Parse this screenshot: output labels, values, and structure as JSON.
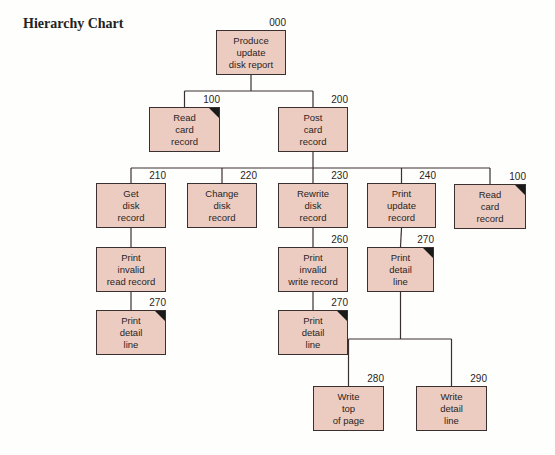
{
  "title": "Hierarchy Chart",
  "colors": {
    "box_fill": "#ecccc0",
    "line": "#3a3030",
    "background": "#fefefc"
  },
  "nodes": [
    {
      "id": "n000",
      "num": "000",
      "label": "Produce\nupdate\ndisk report",
      "x": 216,
      "y": 30,
      "w": 70,
      "h": 45,
      "common": false
    },
    {
      "id": "n100a",
      "num": "100",
      "label": "Read\ncard\nrecord",
      "x": 149,
      "y": 107,
      "w": 71,
      "h": 45,
      "common": true
    },
    {
      "id": "n200",
      "num": "200",
      "label": "Post\ncard\nrecord",
      "x": 278,
      "y": 107,
      "w": 70,
      "h": 45,
      "common": false
    },
    {
      "id": "n210",
      "num": "210",
      "label": "Get\ndisk\nrecord",
      "x": 96,
      "y": 183,
      "w": 70,
      "h": 45,
      "common": false
    },
    {
      "id": "n220",
      "num": "220",
      "label": "Change\ndisk\nrecord",
      "x": 187,
      "y": 183,
      "w": 70,
      "h": 45,
      "common": false
    },
    {
      "id": "n230",
      "num": "230",
      "label": "Rewrite\ndisk\nrecord",
      "x": 278,
      "y": 183,
      "w": 70,
      "h": 45,
      "common": false
    },
    {
      "id": "n240",
      "num": "240",
      "label": "Print\nupdate\nrecord",
      "x": 367,
      "y": 183,
      "w": 69,
      "h": 45,
      "common": false
    },
    {
      "id": "n100b",
      "num": "100",
      "label": "Read\ncard\nrecord",
      "x": 454,
      "y": 184,
      "w": 72,
      "h": 45,
      "common": true
    },
    {
      "id": "n_pirr",
      "num": "",
      "label": "Print\ninvalid\nread record",
      "x": 96,
      "y": 247,
      "w": 70,
      "h": 45,
      "common": false
    },
    {
      "id": "n260",
      "num": "260",
      "label": "Print\ninvalid\nwrite record",
      "x": 278,
      "y": 247,
      "w": 70,
      "h": 45,
      "common": false
    },
    {
      "id": "n270c",
      "num": "270",
      "label": "Print\ndetail\nline",
      "x": 367,
      "y": 247,
      "w": 67,
      "h": 45,
      "common": true
    },
    {
      "id": "n270a",
      "num": "270",
      "label": "Print\ndetail\nline",
      "x": 96,
      "y": 310,
      "w": 70,
      "h": 45,
      "common": true
    },
    {
      "id": "n270b",
      "num": "270",
      "label": "Print\ndetail\nline",
      "x": 278,
      "y": 310,
      "w": 70,
      "h": 45,
      "common": true
    },
    {
      "id": "n280",
      "num": "280",
      "label": "Write\ntop\nof page",
      "x": 313,
      "y": 386,
      "w": 71,
      "h": 45,
      "common": false
    },
    {
      "id": "n290",
      "num": "290",
      "label": "Write\ndetail\nline",
      "x": 416,
      "y": 386,
      "w": 71,
      "h": 45,
      "common": false
    }
  ],
  "edges": [
    [
      "n000",
      "n100a"
    ],
    [
      "n000",
      "n200"
    ],
    [
      "n200",
      "n210"
    ],
    [
      "n200",
      "n220"
    ],
    [
      "n200",
      "n230"
    ],
    [
      "n200",
      "n240"
    ],
    [
      "n200",
      "n100b"
    ],
    [
      "n210",
      "n_pirr"
    ],
    [
      "n_pirr",
      "n270a"
    ],
    [
      "n230",
      "n260"
    ],
    [
      "n260",
      "n270b"
    ],
    [
      "n240",
      "n270c"
    ],
    [
      "n270c",
      "n280"
    ],
    [
      "n270c",
      "n290"
    ]
  ]
}
